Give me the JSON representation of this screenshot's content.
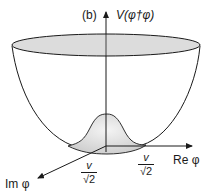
{
  "diagram": {
    "panel_label": "(b)",
    "y_axis_label": "V(φ†φ)",
    "x_axis_label": "Re φ",
    "z_axis_label": "Im φ",
    "tick_x": {
      "num": "v",
      "den": "√2"
    },
    "tick_z": {
      "num": "v",
      "den": "√2"
    },
    "colors": {
      "rim_fill": "#dcdcdc",
      "bump_fill": "#e6e6e6",
      "line": "#1a1a1a"
    }
  }
}
